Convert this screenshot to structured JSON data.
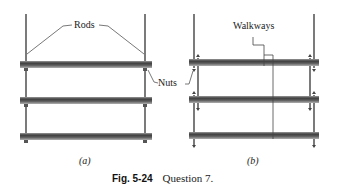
{
  "panels": {
    "a": {
      "label": "(a)",
      "callouts": {
        "rods": "Rods",
        "nuts": "Nuts"
      }
    },
    "b": {
      "label": "(b)",
      "callouts": {
        "walkways": "Walkways"
      }
    }
  },
  "caption": {
    "number": "Fig. 5-24",
    "text": "Question 7."
  },
  "colors": {
    "rod": "#333333",
    "beam_dark": "#4a4a4a",
    "beam_light": "#9a9a9a",
    "leader": "#555555"
  }
}
